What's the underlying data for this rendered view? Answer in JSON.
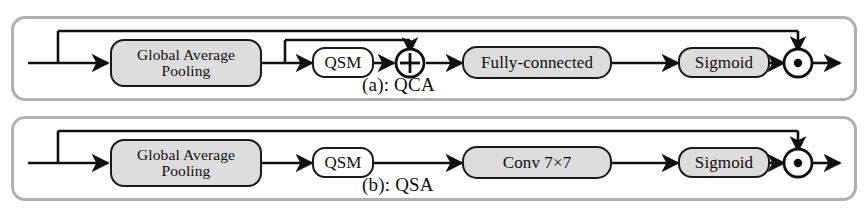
{
  "figure": {
    "type": "diagram",
    "colors": {
      "panel_border": "#b0b0b0",
      "node_border": "#1a1a1a",
      "node_shaded_fill": "#dcdcdc",
      "node_plain_fill": "#ffffff",
      "line": "#111111",
      "page_background": "#ffffff"
    }
  },
  "rows": [
    {
      "id": "qca",
      "caption": "(a): QCA",
      "nodes": [
        {
          "name": "global-average-pooling",
          "label_line1": "Global Average",
          "label_line2": "Pooling",
          "fill": "shaded"
        },
        {
          "name": "qsm",
          "label": "QSM",
          "fill": "plain"
        },
        {
          "name": "add-operator",
          "label": "⊕",
          "fill": "none"
        },
        {
          "name": "fully-connected",
          "label": "Fully-connected",
          "fill": "shaded"
        },
        {
          "name": "sigmoid",
          "label": "Sigmoid",
          "fill": "shaded"
        },
        {
          "name": "multiply-operator",
          "label": "⊙",
          "fill": "none"
        }
      ]
    },
    {
      "id": "qsa",
      "caption": "(b): QSA",
      "nodes": [
        {
          "name": "global-average-pooling",
          "label_line1": "Global Average",
          "label_line2": "Pooling",
          "fill": "shaded"
        },
        {
          "name": "qsm",
          "label": "QSM",
          "fill": "plain"
        },
        {
          "name": "conv",
          "label": "Conv 7×7",
          "fill": "shaded"
        },
        {
          "name": "sigmoid",
          "label": "Sigmoid",
          "fill": "shaded"
        },
        {
          "name": "multiply-operator",
          "label": "⊙",
          "fill": "none"
        }
      ]
    }
  ]
}
